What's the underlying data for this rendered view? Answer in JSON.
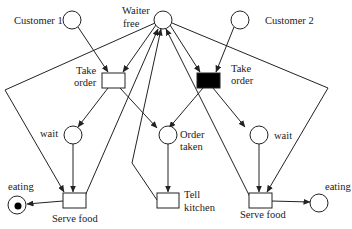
{
  "diagram": {
    "type": "petri-net",
    "colors": {
      "stroke": "#222222",
      "background": "#ffffff",
      "enabled_transition": "#000000"
    },
    "places": [
      {
        "id": "customer1",
        "label": "Customer 1",
        "tokens": 0
      },
      {
        "id": "waiter_free",
        "label_line1": "Waiter",
        "label_line2": "free",
        "tokens": 0
      },
      {
        "id": "customer2",
        "label": "Customer 2",
        "tokens": 0
      },
      {
        "id": "wait1",
        "label": "wait",
        "tokens": 0
      },
      {
        "id": "order_taken",
        "label_line1": "Order",
        "label_line2": "taken",
        "tokens": 0
      },
      {
        "id": "wait2",
        "label": "wait",
        "tokens": 0
      },
      {
        "id": "eating1",
        "label": "eating",
        "tokens": 1
      },
      {
        "id": "eating2",
        "label": "eating",
        "tokens": 0
      }
    ],
    "transitions": [
      {
        "id": "take_order1",
        "label_line1": "Take",
        "label_line2": "order",
        "enabled": false
      },
      {
        "id": "take_order2",
        "label_line1": "Take",
        "label_line2": "order",
        "enabled": true
      },
      {
        "id": "serve_food1",
        "label": "Serve food",
        "enabled": false
      },
      {
        "id": "tell_kitchen",
        "label_line1": "Tell",
        "label_line2": "kitchen",
        "enabled": false
      },
      {
        "id": "serve_food2",
        "label": "Serve food",
        "enabled": false
      }
    ],
    "arcs": [
      [
        "customer1",
        "take_order1"
      ],
      [
        "waiter_free",
        "take_order1"
      ],
      [
        "customer2",
        "take_order2"
      ],
      [
        "waiter_free",
        "take_order2"
      ],
      [
        "take_order1",
        "wait1"
      ],
      [
        "take_order1",
        "order_taken"
      ],
      [
        "take_order2",
        "order_taken"
      ],
      [
        "take_order2",
        "wait2"
      ],
      [
        "wait1",
        "serve_food1"
      ],
      [
        "waiter_free",
        "serve_food1"
      ],
      [
        "serve_food1",
        "waiter_free"
      ],
      [
        "serve_food1",
        "eating1"
      ],
      [
        "order_taken",
        "tell_kitchen"
      ],
      [
        "tell_kitchen",
        "waiter_free"
      ],
      [
        "wait2",
        "serve_food2"
      ],
      [
        "waiter_free",
        "serve_food2"
      ],
      [
        "serve_food2",
        "waiter_free"
      ],
      [
        "serve_food2",
        "eating2"
      ]
    ]
  }
}
